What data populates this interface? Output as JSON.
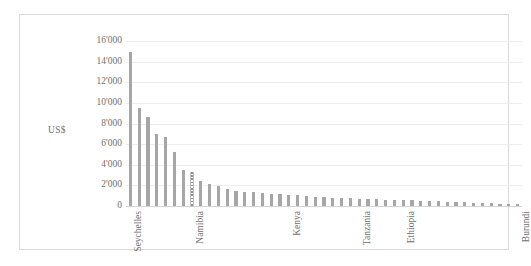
{
  "chart_data": {
    "type": "bar",
    "title": "",
    "subtitle": "",
    "xlabel": "",
    "ylabel": "US$",
    "ylim": [
      0,
      16000
    ],
    "ytick_step": 2000,
    "grid": true,
    "legend": false,
    "legend_position": "none",
    "orientation": "vertical",
    "sort": "descending",
    "bar_color": "#a6a6a6",
    "highlight_color": "#8f8f8f",
    "highlight_index": 7,
    "highlight_style": "dotted-hatched",
    "frame_color": "#d9d9d9",
    "gridline_color": "#ededed",
    "axis_color": "#d4d4d4",
    "text_color": "#6f6f6f",
    "thousands_separator": "'",
    "ytick_labels": [
      "16'000",
      "14'000",
      "12'000",
      "10'000",
      "8'000",
      "6'000",
      "4'000",
      "2'000",
      "0"
    ],
    "ytick_values": [
      16000,
      14000,
      12000,
      10000,
      8000,
      6000,
      4000,
      2000,
      0
    ],
    "visible_category_labels": [
      {
        "index": 0,
        "label": "Seychelles"
      },
      {
        "index": 7,
        "label": "Namibia"
      },
      {
        "index": 18,
        "label": "Kenya"
      },
      {
        "index": 26,
        "label": "Tanzania"
      },
      {
        "index": 31,
        "label": "Ethiopia"
      },
      {
        "index": 44,
        "label": "Burundi"
      }
    ],
    "categories": [
      "Seychelles",
      "",
      "",
      "",
      "",
      "",
      "",
      "Namibia",
      "",
      "",
      "",
      "",
      "",
      "",
      "",
      "",
      "",
      "",
      "Kenya",
      "",
      "",
      "",
      "",
      "",
      "",
      "",
      "Tanzania",
      "",
      "",
      "",
      "",
      "Ethiopia",
      "",
      "",
      "",
      "",
      "",
      "",
      "",
      "",
      "",
      "",
      "",
      "",
      "Burundi"
    ],
    "values": [
      14900,
      9500,
      8600,
      7000,
      6700,
      5200,
      3500,
      3250,
      2450,
      2100,
      1950,
      1680,
      1500,
      1400,
      1340,
      1280,
      1200,
      1150,
      1080,
      1020,
      960,
      900,
      860,
      820,
      790,
      760,
      720,
      690,
      660,
      630,
      600,
      570,
      540,
      510,
      480,
      450,
      420,
      390,
      360,
      330,
      300,
      270,
      240,
      200,
      150
    ],
    "n_bars": 45
  }
}
